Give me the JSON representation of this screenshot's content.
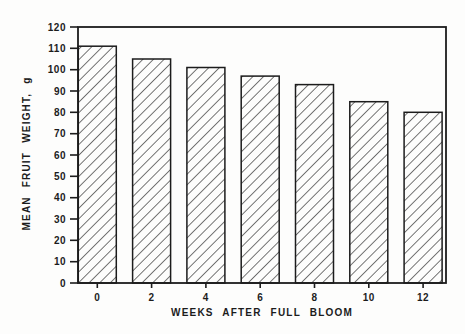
{
  "page": {
    "background": "#fdfdfc",
    "ink_color": "#1c1c1c"
  },
  "chart_data": {
    "type": "bar",
    "title": "",
    "xlabel": "WEEKS AFTER FULL BLOOM",
    "ylabel": "MEAN FRUIT WEIGHT, g",
    "categories": [
      "0",
      "2",
      "4",
      "6",
      "8",
      "10",
      "12"
    ],
    "values": [
      111,
      105,
      101,
      97,
      93,
      85,
      80
    ],
    "ylim": [
      0,
      120
    ],
    "ytick_step": 10,
    "yticks": [
      0,
      10,
      20,
      30,
      40,
      50,
      60,
      70,
      80,
      90,
      100,
      110,
      120
    ],
    "grid": false,
    "legend": null,
    "bar_fill_style": "diagonal-hatch",
    "hatch_direction": "forward-slash",
    "bar_outline_color": "#1c1c1c",
    "axis_color": "#1c1c1c",
    "frame": "full-box"
  }
}
